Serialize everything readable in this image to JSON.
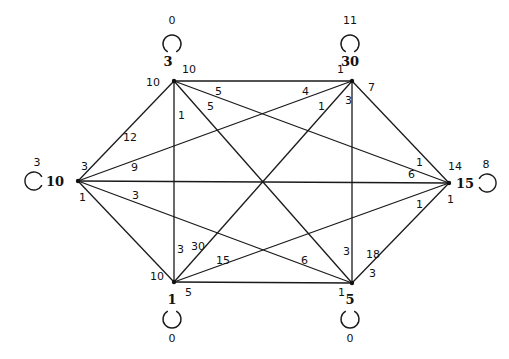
{
  "graph": {
    "nodes": [
      {
        "id": "n3",
        "name": "3",
        "loop_weight": "0"
      },
      {
        "id": "n30",
        "name": "30",
        "loop_weight": "11"
      },
      {
        "id": "n10",
        "name": "10",
        "loop_weight": "3"
      },
      {
        "id": "n15",
        "name": "15",
        "loop_weight": "8"
      },
      {
        "id": "n1",
        "name": "1",
        "loop_weight": "0"
      },
      {
        "id": "n5",
        "name": "5",
        "loop_weight": "0"
      }
    ],
    "edges": [
      {
        "from": "n3",
        "to": "n30",
        "w_from": "10",
        "w_to": "1"
      },
      {
        "from": "n3",
        "to": "n10",
        "w_from": "10",
        "w_to": "12"
      },
      {
        "from": "n3",
        "to": "n1",
        "w_from": "1",
        "w_to": "3"
      },
      {
        "from": "n3",
        "to": "n15",
        "w_from": "5",
        "w_to": "1"
      },
      {
        "from": "n3",
        "to": "n5",
        "w_from": "5",
        "w_to": "3"
      },
      {
        "from": "n30",
        "to": "n10",
        "w_from": "4",
        "w_to": "9"
      },
      {
        "from": "n30",
        "to": "n1",
        "w_from": "1",
        "w_to": "30"
      },
      {
        "from": "n30",
        "to": "n5",
        "w_from": "3",
        "w_to": "18"
      },
      {
        "from": "n30",
        "to": "n15",
        "w_from": "7",
        "w_to": "14"
      },
      {
        "from": "n10",
        "to": "n15",
        "w_from": "3",
        "w_to": "6"
      },
      {
        "from": "n10",
        "to": "n5",
        "w_from": "3",
        "w_to": "6"
      },
      {
        "from": "n10",
        "to": "n1",
        "w_from": "1",
        "w_to": "10"
      },
      {
        "from": "n1",
        "to": "n5",
        "w_from": "5",
        "w_to": "1"
      },
      {
        "from": "n1",
        "to": "n15",
        "w_from": "15",
        "w_to": "1"
      },
      {
        "from": "n5",
        "to": "n15",
        "w_from": "3",
        "w_to": "1"
      }
    ],
    "labels": [
      {
        "text": "10",
        "near": "n3-top"
      },
      {
        "text": "10",
        "near": "n3-left"
      },
      {
        "text": "5",
        "near": "n3-n15"
      },
      {
        "text": "5",
        "near": "n3-n5"
      },
      {
        "text": "1",
        "near": "n3-n1"
      },
      {
        "text": "1",
        "near": "n30-top"
      },
      {
        "text": "4",
        "near": "n30-n10"
      },
      {
        "text": "1",
        "near": "n30-n1"
      },
      {
        "text": "3",
        "near": "n30-n5"
      },
      {
        "text": "7",
        "near": "n30-n15"
      },
      {
        "text": "12",
        "near": "n10-n3"
      },
      {
        "text": "3",
        "near": "n10-top"
      },
      {
        "text": "9",
        "near": "n10-n30"
      },
      {
        "text": "1",
        "near": "n10-bottom"
      },
      {
        "text": "3",
        "near": "n10-n5"
      },
      {
        "text": "1",
        "near": "n15-n3"
      },
      {
        "text": "14",
        "near": "n15-top"
      },
      {
        "text": "6",
        "near": "n15-n10"
      },
      {
        "text": "1",
        "near": "n15-n1"
      },
      {
        "text": "1",
        "near": "n15-bottom"
      },
      {
        "text": "3",
        "near": "n1-n3"
      },
      {
        "text": "30",
        "near": "n1-n30"
      },
      {
        "text": "15",
        "near": "n1-n15"
      },
      {
        "text": "10",
        "near": "n1-left"
      },
      {
        "text": "5",
        "near": "n1-bottom"
      },
      {
        "text": "6",
        "near": "n5-n10"
      },
      {
        "text": "3",
        "near": "n5-n30"
      },
      {
        "text": "18",
        "near": "n5-n15"
      },
      {
        "text": "3",
        "near": "n5-right"
      },
      {
        "text": "1",
        "near": "n5-bottom"
      }
    ]
  }
}
